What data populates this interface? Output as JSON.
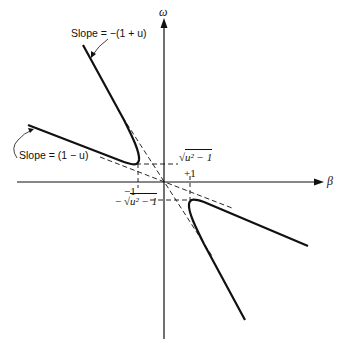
{
  "diagram": {
    "type": "hyperbola-dispersion-plot",
    "axes": {
      "horizontal_label": "β",
      "vertical_label": "ω"
    },
    "annotations": {
      "slope_upper": "Slope = −(1 + u)",
      "slope_lower": "Slope = (1 − u)",
      "tick_neg_one": "−1",
      "tick_pos_one": "+1",
      "omega_pos": "u² − 1",
      "omega_neg_prefix": "−",
      "omega_neg": "u² − 1",
      "sqrt_symbol": "√"
    },
    "colors": {
      "ink": "#111111",
      "background": "#ffffff"
    }
  }
}
